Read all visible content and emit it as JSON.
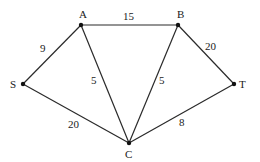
{
  "graph": {
    "nodes": [
      {
        "id": "A",
        "label": "A",
        "x": 81,
        "y": 25,
        "lx": 79,
        "ly": 18
      },
      {
        "id": "B",
        "label": "B",
        "x": 178,
        "y": 25,
        "lx": 177,
        "ly": 18
      },
      {
        "id": "S",
        "label": "S",
        "x": 23,
        "y": 84,
        "lx": 10,
        "ly": 88
      },
      {
        "id": "T",
        "label": "T",
        "x": 234,
        "y": 84,
        "lx": 239,
        "ly": 88
      },
      {
        "id": "C",
        "label": "C",
        "x": 129,
        "y": 143,
        "lx": 125,
        "ly": 158
      }
    ],
    "edges": [
      {
        "from": "S",
        "to": "A",
        "weight": "9",
        "lx": 40,
        "ly": 52
      },
      {
        "from": "A",
        "to": "B",
        "weight": "15",
        "lx": 123,
        "ly": 20
      },
      {
        "from": "A",
        "to": "C",
        "weight": "5",
        "lx": 91,
        "ly": 84
      },
      {
        "from": "B",
        "to": "C",
        "weight": "5",
        "lx": 159,
        "ly": 84
      },
      {
        "from": "B",
        "to": "T",
        "weight": "20",
        "lx": 205,
        "ly": 50
      },
      {
        "from": "S",
        "to": "C",
        "weight": "20",
        "lx": 68,
        "ly": 128
      },
      {
        "from": "C",
        "to": "T",
        "weight": "8",
        "lx": 179,
        "ly": 126
      }
    ]
  }
}
